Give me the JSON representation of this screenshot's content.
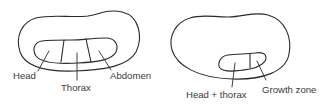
{
  "diagram": {
    "embryos": [
      {
        "id": "segmented-embryo",
        "labels": {
          "head": "Head",
          "thorax": "Thorax",
          "abdomen": "Abdomen"
        }
      },
      {
        "id": "growth-zone-embryo",
        "labels": {
          "head_thorax": "Head + thorax",
          "growth_zone": "Growth zone"
        }
      }
    ],
    "colors": {
      "stroke": "#2a2a2a",
      "text": "#3a3a3a",
      "background": "#ffffff"
    }
  }
}
